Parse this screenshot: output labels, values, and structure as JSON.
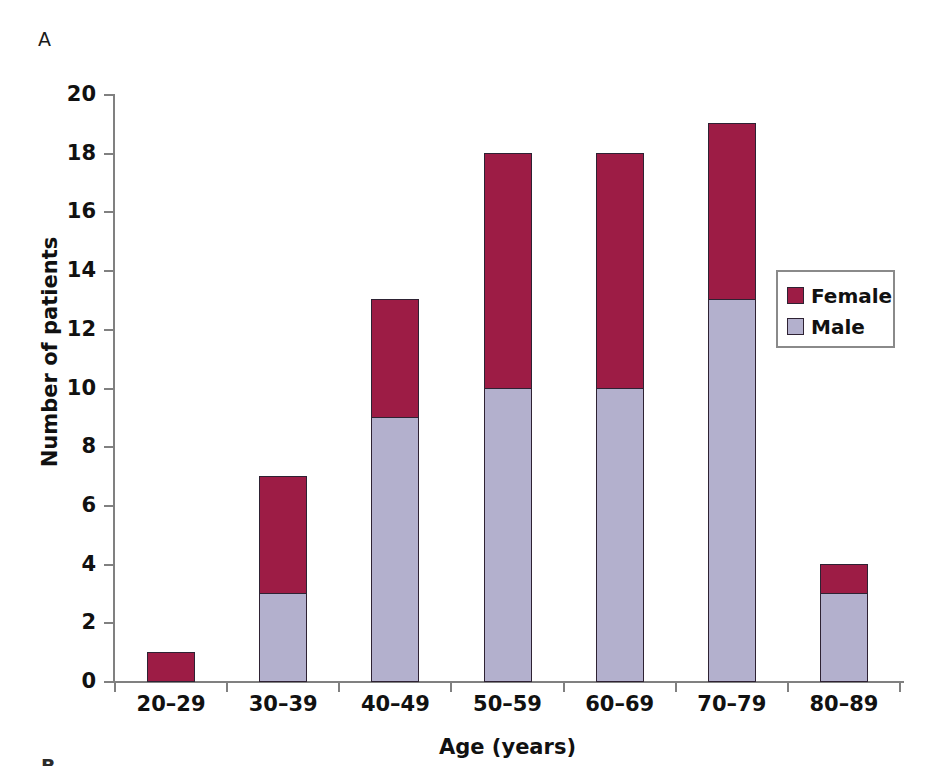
{
  "panel": {
    "label": "A",
    "next_label": "B"
  },
  "legend": {
    "position": "inside-right",
    "items": [
      {
        "label": "Female",
        "color": "#9d1c45",
        "key": "female"
      },
      {
        "label": "Male",
        "color": "#b3b0cd",
        "key": "male"
      }
    ]
  },
  "chart_data": {
    "type": "bar",
    "stacked": true,
    "title": "",
    "subtitle": "",
    "xlabel": "Age (years)",
    "ylabel": "Number of patients",
    "categories": [
      "20–29",
      "30–39",
      "40–49",
      "50–59",
      "60–69",
      "70–79",
      "80–89"
    ],
    "series": [
      {
        "name": "Male",
        "color": "#b3b0cd",
        "values": [
          0,
          3,
          9,
          10,
          10,
          13,
          3
        ]
      },
      {
        "name": "Female",
        "color": "#9d1c45",
        "values": [
          1,
          4,
          4,
          8,
          8,
          6,
          1
        ]
      }
    ],
    "totals": [
      1,
      7,
      13,
      18,
      18,
      19,
      4
    ],
    "ylim": [
      0,
      20
    ],
    "ytick_labels": [
      "0",
      "2",
      "4",
      "6",
      "8",
      "10",
      "12",
      "14",
      "16",
      "18",
      "20"
    ],
    "yticks": [
      0,
      2,
      4,
      6,
      8,
      10,
      12,
      14,
      16,
      18,
      20
    ],
    "grid": false,
    "legend_position": "inside-right"
  }
}
